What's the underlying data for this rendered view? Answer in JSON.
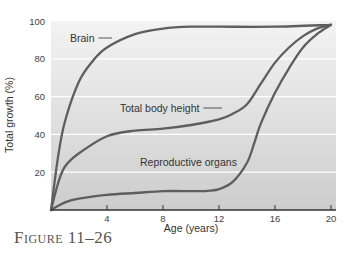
{
  "caption": "Figure 11–26",
  "chart_data": {
    "type": "line",
    "title": "",
    "xlabel": "Age (years)",
    "ylabel": "Total growth (%)",
    "xlim": [
      0,
      20
    ],
    "ylim": [
      0,
      100
    ],
    "xticks": [
      4,
      8,
      12,
      16,
      20
    ],
    "yticks": [
      20,
      40,
      60,
      80,
      100
    ],
    "grid": "horizontal white lines at 20, 40, 60, 80",
    "legend": "inline labels with leader lines",
    "series": [
      {
        "name": "Brain",
        "x": [
          0,
          0.5,
          1,
          2,
          3,
          4,
          6,
          8,
          10,
          12,
          16,
          20
        ],
        "y": [
          0,
          28,
          47,
          68,
          79,
          86,
          93,
          96,
          97,
          97,
          97,
          98
        ],
        "label_pos": [
          70,
          38
        ],
        "leader_to": [
          112,
          38
        ]
      },
      {
        "name": "Total body height",
        "x": [
          0,
          0.5,
          1,
          2,
          4,
          6,
          8,
          10,
          12,
          13,
          14,
          15,
          16,
          17,
          18,
          19,
          20
        ],
        "y": [
          0,
          14,
          23,
          30,
          39,
          42,
          43,
          45,
          48,
          51,
          56,
          67,
          78,
          86,
          92,
          96,
          98
        ],
        "label_pos": [
          120,
          108
        ],
        "leader_to": [
          222,
          108
        ]
      },
      {
        "name": "Reproductive organs",
        "x": [
          0,
          1,
          2,
          4,
          6,
          8,
          10,
          11,
          12,
          13,
          14,
          14.5,
          15,
          16,
          17,
          18,
          19,
          20
        ],
        "y": [
          0,
          4,
          6,
          8,
          9,
          10,
          10,
          10,
          11,
          15,
          25,
          35,
          46,
          62,
          75,
          86,
          93,
          98
        ],
        "label_pos": [
          140,
          162
        ],
        "leader_to": [
          241,
          162
        ]
      }
    ]
  }
}
